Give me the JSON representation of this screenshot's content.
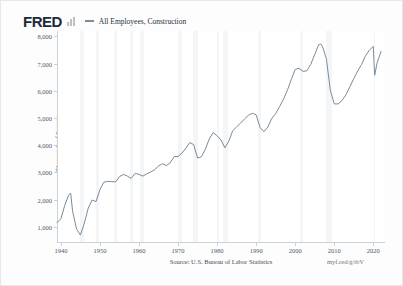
{
  "brand": {
    "logo_text": "FRED",
    "logo_color": "#1a2a3a",
    "bars_icon": "bar-chart-icon"
  },
  "legend": {
    "marker_icon": "line-swatch-icon",
    "label": "All Employees, Construction",
    "color": "#7a8b99"
  },
  "footer": {
    "source": "Source: U.S. Bureau of Labor Statistics",
    "url": "myf.red/g/tbV"
  },
  "chart_data": {
    "type": "line",
    "title": "All Employees, Construction",
    "xlabel": "",
    "ylabel": "Thousands of Persons",
    "xlim": [
      1939,
      2023
    ],
    "ylim": [
      400,
      8200
    ],
    "grid": false,
    "legend_position": "top",
    "line_color": "#7a8b99",
    "xticks": [
      "1940",
      "1950",
      "1960",
      "1970",
      "1980",
      "1990",
      "2000",
      "2010",
      "2020"
    ],
    "xtick_values": [
      1940,
      1950,
      1960,
      1970,
      1980,
      1990,
      2000,
      2010,
      2020
    ],
    "yticks": [
      "1,000",
      "2,000",
      "3,000",
      "4,000",
      "5,000",
      "6,000",
      "7,000",
      "8,000"
    ],
    "ytick_values": [
      1000,
      2000,
      3000,
      4000,
      5000,
      6000,
      7000,
      8000
    ],
    "recession_bands": [
      [
        1945.0,
        1945.8
      ],
      [
        1948.9,
        1949.8
      ],
      [
        1953.5,
        1954.4
      ],
      [
        1957.6,
        1958.4
      ],
      [
        1960.3,
        1961.2
      ],
      [
        1969.9,
        1970.9
      ],
      [
        1973.9,
        1975.2
      ],
      [
        1980.1,
        1980.6
      ],
      [
        1981.5,
        1982.9
      ],
      [
        1990.6,
        1991.2
      ],
      [
        2001.2,
        2001.9
      ],
      [
        2007.9,
        2009.5
      ],
      [
        2020.1,
        2020.4
      ]
    ],
    "x": [
      1939.0,
      1940.0,
      1941.0,
      1942.0,
      1942.5,
      1943.0,
      1944.0,
      1945.0,
      1946.0,
      1947.0,
      1948.0,
      1949.0,
      1950.0,
      1951.0,
      1952.0,
      1953.0,
      1954.0,
      1955.0,
      1956.0,
      1957.0,
      1958.0,
      1959.0,
      1960.0,
      1961.0,
      1962.0,
      1963.0,
      1964.0,
      1965.0,
      1966.0,
      1967.0,
      1968.0,
      1969.0,
      1970.0,
      1971.0,
      1972.0,
      1973.0,
      1974.0,
      1975.0,
      1976.0,
      1977.0,
      1978.0,
      1979.0,
      1980.0,
      1981.0,
      1982.0,
      1983.0,
      1984.0,
      1985.0,
      1986.0,
      1987.0,
      1988.0,
      1989.0,
      1990.0,
      1991.0,
      1992.0,
      1993.0,
      1994.0,
      1995.0,
      1996.0,
      1997.0,
      1998.0,
      1999.0,
      2000.0,
      2001.0,
      2002.0,
      2003.0,
      2004.0,
      2005.0,
      2006.0,
      2006.5,
      2007.0,
      2008.0,
      2009.0,
      2010.0,
      2011.0,
      2012.0,
      2013.0,
      2014.0,
      2015.0,
      2016.0,
      2017.0,
      2018.0,
      2019.0,
      2020.0,
      2020.2,
      2020.35,
      2021.0,
      2022.0
    ],
    "y": [
      1150,
      1294,
      1790,
      2170,
      2230,
      1567,
      920,
      690,
      1132,
      1683,
      1982,
      1922,
      2364,
      2637,
      2668,
      2659,
      2646,
      2839,
      2923,
      2863,
      2778,
      2960,
      2926,
      2859,
      2948,
      3010,
      3097,
      3232,
      3317,
      3248,
      3350,
      3575,
      3588,
      3704,
      3889,
      4097,
      4020,
      3525,
      3576,
      3851,
      4229,
      4463,
      4346,
      4188,
      3905,
      4146,
      4530,
      4673,
      4810,
      4958,
      5098,
      5171,
      5120,
      4650,
      4492,
      4668,
      4986,
      5160,
      5418,
      5691,
      6020,
      6415,
      6787,
      6826,
      6716,
      6735,
      6976,
      7336,
      7691,
      7726,
      7630,
      7162,
      6016,
      5518,
      5518,
      5646,
      5856,
      6148,
      6446,
      6727,
      6969,
      7290,
      7493,
      7636,
      7010,
      6570,
      7040,
      7450
    ]
  }
}
